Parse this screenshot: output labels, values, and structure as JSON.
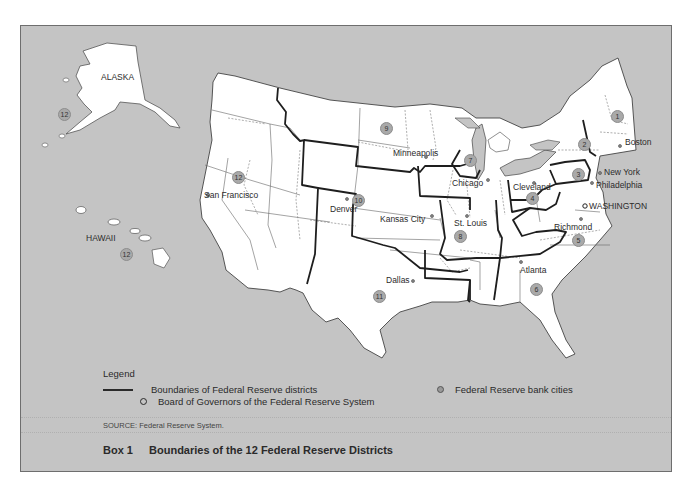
{
  "figure": {
    "caption_label": "Box 1",
    "caption_title": "Boundaries of the 12 Federal Reserve Districts",
    "source": "SOURCE: Federal Reserve System."
  },
  "legend": {
    "title": "Legend",
    "items": [
      {
        "symbol": "thick-line",
        "label": "Boundaries of Federal Reserve districts"
      },
      {
        "symbol": "open-circle",
        "label": "Board of Governors of the Federal Reserve System"
      },
      {
        "symbol": "filled-dot",
        "label": "Federal Reserve bank cities"
      }
    ]
  },
  "regions": {
    "alaska": "ALASKA",
    "hawaii": "HAWAII"
  },
  "districts": [
    {
      "number": "1",
      "city": "Boston"
    },
    {
      "number": "2",
      "city": "New York"
    },
    {
      "number": "3",
      "city": "Philadelphia"
    },
    {
      "number": "4",
      "city": "Cleveland"
    },
    {
      "number": "5",
      "city": "Richmond"
    },
    {
      "number": "6",
      "city": "Atlanta"
    },
    {
      "number": "7",
      "city": "Chicago"
    },
    {
      "number": "8",
      "city": "St. Louis"
    },
    {
      "number": "9",
      "city": "Minneapolis"
    },
    {
      "number": "10",
      "city": "Kansas City"
    },
    {
      "number": "11",
      "city": "Dallas"
    },
    {
      "number": "12",
      "city": "San Francisco"
    }
  ],
  "extra_labels": {
    "denver": "Denver",
    "washington": "WASHINGTON",
    "alaska_district": "12",
    "hawaii_district": "12"
  },
  "colors": {
    "background": "#c4c4c4",
    "land": "#ffffff",
    "district_boundary": "#1e1e1e",
    "state_boundary": "#666666",
    "badge": "#a9a9a9"
  }
}
